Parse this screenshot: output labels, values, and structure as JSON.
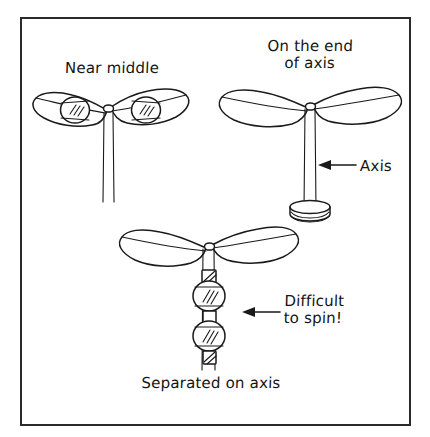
{
  "figure": {
    "title_visible": false,
    "border_color": "#2b2b2b",
    "ink_color": "#1a1a1a",
    "background_color": "#ffffff",
    "style": "hand-drawn line diagram"
  },
  "diagrams": [
    {
      "id": "near-middle",
      "caption": "Near middle",
      "caption_position": "above",
      "description": "propeller with two hatched wheels placed near the middle of the blades, on a two-line vertical axis"
    },
    {
      "id": "on-the-end-of-axis",
      "caption": "On the end\nof axis",
      "caption_position": "above",
      "description": "propeller mounted on the top end of a vertical axis standing on a round base"
    },
    {
      "id": "separated-on-axis",
      "caption": "Separated on axis",
      "caption_position": "below",
      "description": "propeller on vertical axis with two hatched wheels separated along the axis"
    }
  ],
  "annotations": [
    {
      "id": "axis-callout",
      "text": "Axis",
      "arrow": "left",
      "points_to": "vertical axis shaft of the on-the-end-of-axis diagram"
    },
    {
      "id": "difficult-callout",
      "text": "Difficult\nto spin!",
      "arrow": "left",
      "points_to": "separated wheels on the axis of the separated-on-axis diagram"
    }
  ],
  "labels": {
    "near_middle": "Near middle",
    "on_the_end_line1": "On the end",
    "on_the_end_line2": "of axis",
    "axis": "Axis",
    "difficult_line1": "Difficult",
    "difficult_line2": "to spin!",
    "separated_on_axis": "Separated on axis"
  }
}
